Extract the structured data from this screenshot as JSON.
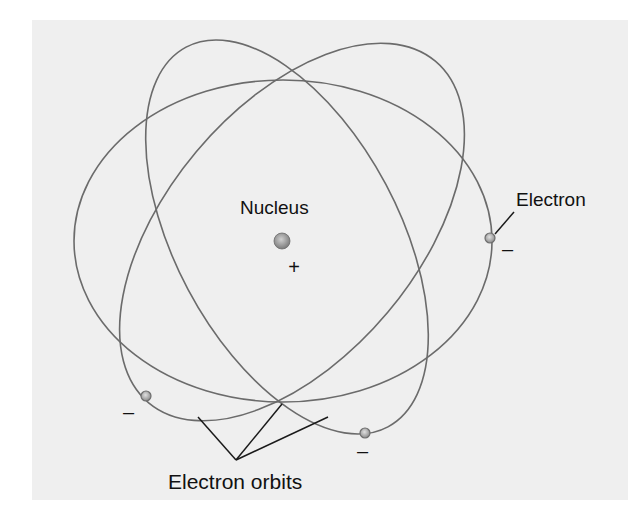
{
  "diagram": {
    "panel": {
      "x": 32,
      "y": 20,
      "width": 596,
      "height": 480,
      "color": "#efefef"
    },
    "colors": {
      "orbit": "#6b6b6b",
      "leader": "#1a1a1a",
      "text": "#111111",
      "nucleus_light": "#cfcfcf",
      "nucleus_dark": "#7a7a7a",
      "electron_light": "#e0e0e0",
      "electron_dark": "#8a8a8a"
    },
    "labels": {
      "nucleus": {
        "text": "Nucleus",
        "x": 240,
        "y": 214,
        "size": 19
      },
      "electron": {
        "text": "Electron",
        "x": 516,
        "y": 206,
        "size": 19
      },
      "electron_orbits": {
        "text": "Electron orbits",
        "x": 168,
        "y": 489,
        "size": 21
      }
    },
    "nucleus": {
      "cx": 282,
      "cy": 241,
      "r": 8,
      "charge": {
        "symbol": "+",
        "x": 294,
        "y": 274,
        "size": 20
      }
    },
    "orbits": [
      {
        "name": "orbit-horizontal",
        "cx": 283,
        "cy": 241,
        "rx": 209,
        "ry": 161,
        "rotate": 0
      },
      {
        "name": "orbit-tilted-right",
        "cx": 292,
        "cy": 232,
        "rx": 223,
        "ry": 125,
        "rotate": -50
      },
      {
        "name": "orbit-tilted-left",
        "cx": 287,
        "cy": 237,
        "rx": 215,
        "ry": 112,
        "rotate": 62
      }
    ],
    "electrons": [
      {
        "name": "electron-right",
        "cx": 490,
        "cy": 238,
        "r": 5,
        "charge": {
          "symbol": "–",
          "x": 502,
          "y": 256,
          "size": 20
        }
      },
      {
        "name": "electron-bottom-left",
        "cx": 146,
        "cy": 396,
        "r": 5,
        "charge": {
          "symbol": "–",
          "x": 123,
          "y": 419,
          "size": 20
        }
      },
      {
        "name": "electron-bottom",
        "cx": 365,
        "cy": 433,
        "r": 5,
        "charge": {
          "symbol": "–",
          "x": 357,
          "y": 458,
          "size": 20
        }
      }
    ],
    "leaders": {
      "electron": {
        "x1": 514,
        "y1": 212,
        "x2": 495,
        "y2": 234
      },
      "orbits": {
        "apex": {
          "x": 236,
          "y": 460
        },
        "targets": [
          {
            "x": 198,
            "y": 417
          },
          {
            "x": 282,
            "y": 404
          },
          {
            "x": 328,
            "y": 417
          }
        ]
      }
    }
  }
}
